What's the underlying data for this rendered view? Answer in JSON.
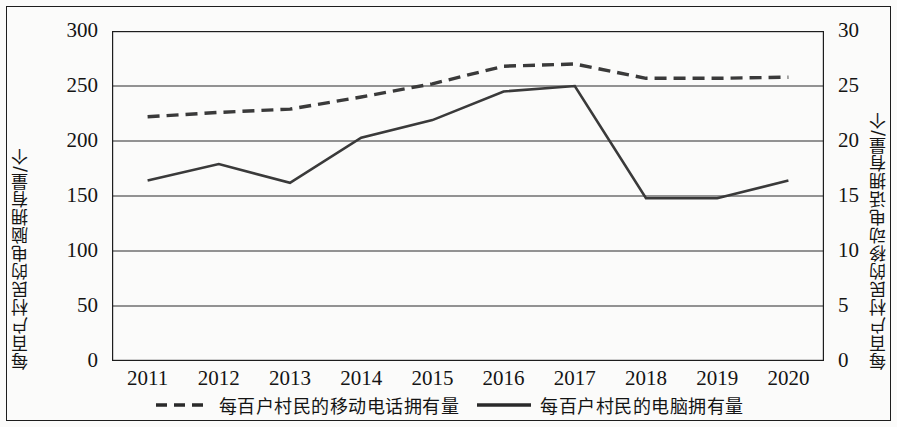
{
  "chart_data": {
    "type": "line",
    "title": "",
    "xlabel": "",
    "categories": [
      "2011",
      "2012",
      "2013",
      "2014",
      "2015",
      "2016",
      "2017",
      "2018",
      "2019",
      "2020"
    ],
    "grid": true,
    "legend_position": "bottom",
    "axes": {
      "left": {
        "label": "每百户村民的电脑拥有量/个",
        "ticks": [
          "0",
          "50",
          "100",
          "150",
          "200",
          "250",
          "300"
        ],
        "tick_values": [
          0,
          50,
          100,
          150,
          200,
          250,
          300
        ],
        "ylim": [
          0,
          300
        ]
      },
      "right": {
        "label": "每百户村民的移动电话拥有量/个",
        "ticks": [
          "0",
          "5",
          "10",
          "15",
          "20",
          "25",
          "30"
        ],
        "tick_values": [
          0,
          5,
          10,
          15,
          20,
          25,
          30
        ],
        "ylim": [
          0,
          30
        ]
      }
    },
    "series": [
      {
        "name": "每百户村民的移动电话拥有量",
        "axis": "right",
        "style": "dashed",
        "color": "#3a3a3a",
        "values": [
          22.2,
          22.6,
          22.9,
          24.0,
          25.2,
          26.8,
          27.0,
          25.7,
          25.7,
          25.8
        ]
      },
      {
        "name": "每百户村民的电脑拥有量",
        "axis": "left",
        "style": "solid",
        "color": "#3a3a3a",
        "values": [
          164,
          179,
          162,
          203,
          219,
          245,
          250,
          148,
          148,
          164
        ]
      }
    ]
  },
  "legend": {
    "items": [
      {
        "label": "每百户村民的移动电话拥有量",
        "style": "dashed"
      },
      {
        "label": "每百户村民的电脑拥有量",
        "style": "solid"
      }
    ]
  }
}
